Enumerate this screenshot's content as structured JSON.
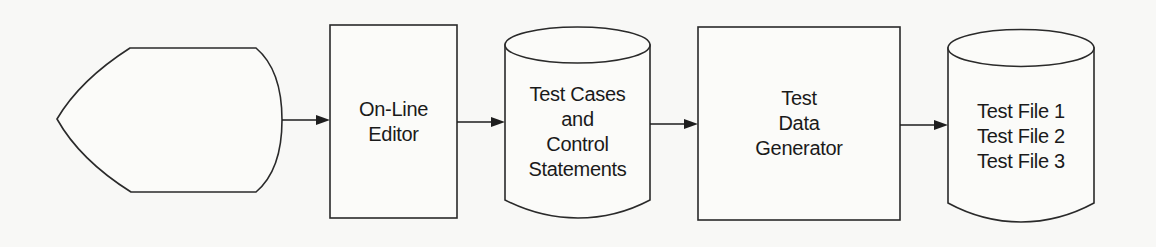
{
  "diagram": {
    "type": "flowchart",
    "direction": "left-to-right",
    "colors": {
      "background": "#f8f8f6",
      "stroke": "#2a2a2a",
      "text": "#1a1a1a"
    },
    "nodes": [
      {
        "id": "display",
        "shape": "display",
        "lines": []
      },
      {
        "id": "editor",
        "shape": "process",
        "lines": [
          "On-Line",
          "Editor"
        ]
      },
      {
        "id": "test-cases",
        "shape": "stored-data",
        "lines": [
          "Test Cases",
          "and",
          "Control",
          "Statements"
        ]
      },
      {
        "id": "generator",
        "shape": "process",
        "lines": [
          "Test",
          "Data",
          "Generator"
        ]
      },
      {
        "id": "test-files",
        "shape": "stored-data",
        "lines": [
          "Test File 1",
          "Test File 2",
          "Test File 3"
        ]
      }
    ],
    "edges": [
      {
        "from": "display",
        "to": "editor"
      },
      {
        "from": "editor",
        "to": "test-cases"
      },
      {
        "from": "test-cases",
        "to": "generator"
      },
      {
        "from": "generator",
        "to": "test-files"
      }
    ]
  }
}
